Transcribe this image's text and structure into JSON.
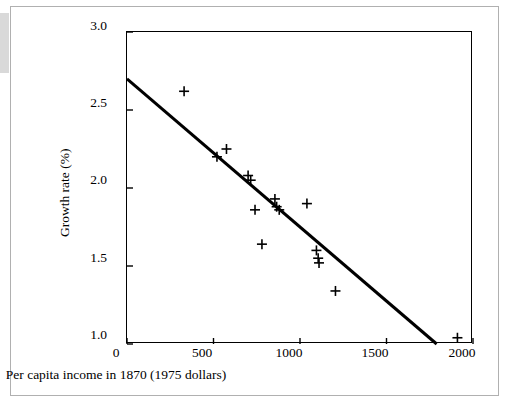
{
  "chart_data": {
    "type": "scatter",
    "title": "",
    "xlabel": "Per capita income in 1870 (1975 dollars)",
    "ylabel": "Growth rate (%)",
    "xlim": [
      0,
      2000
    ],
    "ylim": [
      1.0,
      3.0
    ],
    "xticks": [
      0,
      500,
      1000,
      1500,
      2000
    ],
    "xtick_labels": [
      "0",
      "500",
      "1000",
      "1500",
      "2000"
    ],
    "yticks": [
      1.0,
      1.5,
      2.0,
      2.5,
      3.0
    ],
    "ytick_labels": [
      "1.0",
      "1.5",
      "2.0",
      "2.5",
      "3.0"
    ],
    "grid": false,
    "legend": "none",
    "marker": "plus",
    "points": [
      {
        "x": 330,
        "y": 2.62
      },
      {
        "x": 520,
        "y": 2.2
      },
      {
        "x": 575,
        "y": 2.25
      },
      {
        "x": 700,
        "y": 2.08
      },
      {
        "x": 715,
        "y": 2.05
      },
      {
        "x": 740,
        "y": 1.86
      },
      {
        "x": 780,
        "y": 1.64
      },
      {
        "x": 855,
        "y": 1.93
      },
      {
        "x": 865,
        "y": 1.88
      },
      {
        "x": 880,
        "y": 1.86
      },
      {
        "x": 1040,
        "y": 1.9
      },
      {
        "x": 1095,
        "y": 1.6
      },
      {
        "x": 1105,
        "y": 1.55
      },
      {
        "x": 1110,
        "y": 1.52
      },
      {
        "x": 1205,
        "y": 1.34
      },
      {
        "x": 1910,
        "y": 1.04
      }
    ],
    "fit_line": {
      "name": "regression-line",
      "x_start": 0,
      "y_start": 2.7,
      "x_end": 1790,
      "y_end": 1.0
    }
  }
}
